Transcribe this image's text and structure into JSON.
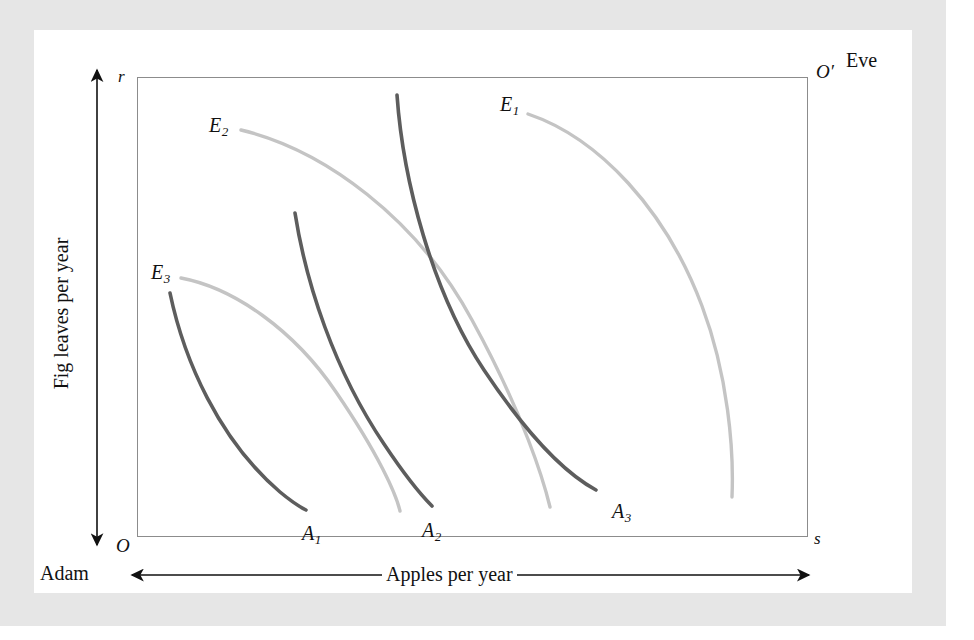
{
  "figure": {
    "type": "edgeworth-box",
    "axes": {
      "x_title": "Apples per year",
      "y_title": "Fig leaves per year",
      "x_arrow": "double-headed",
      "y_arrow": "double-headed"
    },
    "corners": {
      "origin_adam": "O",
      "origin_eve": "O′",
      "top_left_tick": "r",
      "bottom_right_tick": "s"
    },
    "persons": {
      "adam": "Adam",
      "eve": "Eve"
    },
    "colors": {
      "adam_curve": "#5d5d5d",
      "eve_curve": "#c4c4c4",
      "box_border": "#8c8c8c",
      "text": "#111111",
      "frame": "#e6e6e6",
      "background": "#ffffff"
    },
    "curve_labels": {
      "a1_base": "A",
      "a1_sub": "1",
      "a2_base": "A",
      "a2_sub": "2",
      "a3_base": "A",
      "a3_sub": "3",
      "e1_base": "E",
      "e1_sub": "1",
      "e2_base": "E",
      "e2_sub": "2",
      "e3_base": "E",
      "e3_sub": "3"
    }
  },
  "chart_data": {
    "type": "line",
    "title": "",
    "xlabel": "Apples per year",
    "ylabel": "Fig leaves per year",
    "grid": false,
    "legend": "inline-curve-labels",
    "box": {
      "x0": 103,
      "y0": 507,
      "x1": 774,
      "y1": 47
    },
    "series": [
      {
        "name": "A1",
        "owner": "Adam",
        "color": "#5d5d5d",
        "label": "A₁",
        "label_x": 268,
        "label_y": 493,
        "path": "M 136,263 C 150,330 185,410 246,462 C 258,472 266,477 272,480"
      },
      {
        "name": "A2",
        "owner": "Adam",
        "color": "#5d5d5d",
        "label": "A₂",
        "label_x": 388,
        "label_y": 490,
        "path": "M 261,183 C 272,253 300,340 350,414 C 374,450 390,468 398,476"
      },
      {
        "name": "A3",
        "owner": "Adam",
        "color": "#5d5d5d",
        "label": "A₃",
        "label_x": 578,
        "label_y": 471,
        "path": "M 363,65 C 369,150 398,262 450,340 C 500,415 538,447 562,460"
      },
      {
        "name": "E1",
        "owner": "Eve",
        "color": "#c4c4c4",
        "label": "E₁",
        "label_x": 466,
        "label_y": 64,
        "path": "M 494,84 C 565,108 632,180 668,276 C 694,345 700,420 698,467"
      },
      {
        "name": "E2",
        "owner": "Eve",
        "color": "#c4c4c4",
        "label": "E₂",
        "label_x": 175,
        "label_y": 85,
        "path": "M 207,100 C 290,120 383,188 438,290 C 490,385 510,452 516,477"
      },
      {
        "name": "E3",
        "owner": "Eve",
        "color": "#c4c4c4",
        "label": "E₃",
        "label_x": 117,
        "label_y": 232,
        "path": "M 147,248 C 200,258 260,300 302,362 C 345,425 362,464 366,481"
      }
    ]
  }
}
